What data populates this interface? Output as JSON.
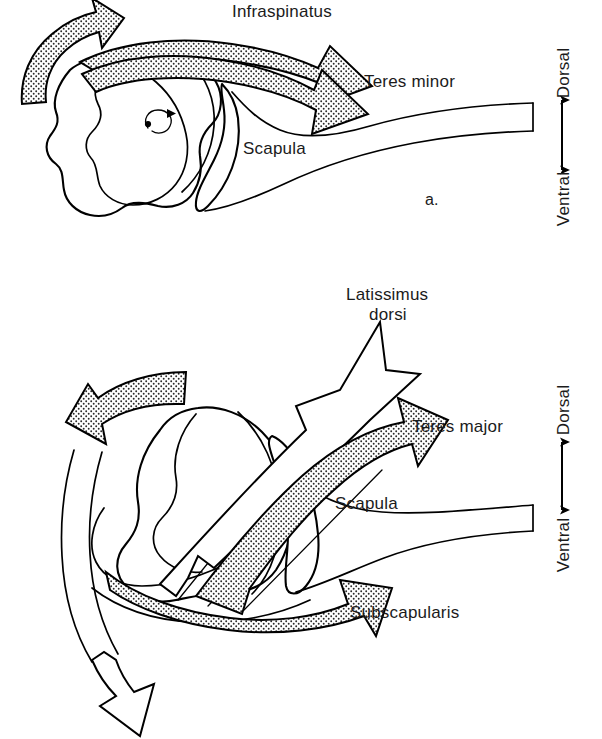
{
  "figure": {
    "panels": [
      {
        "id": "a",
        "panel_label": "a.",
        "labels": {
          "infraspinatus": "Infraspinatus",
          "teres_minor": "Teres minor",
          "scapula": "Scapula"
        },
        "orientation": {
          "dorsal": "Dorsal",
          "ventral": "Ventral"
        }
      },
      {
        "id": "b",
        "panel_label": "",
        "labels": {
          "latissimus_line1": "Latissimus",
          "latissimus_line2": "dorsi",
          "teres_major": "Teres major",
          "scapula": "Scapula",
          "subscapularis": "Subscapularis"
        },
        "orientation": {
          "dorsal": "Dorsal",
          "ventral": "Ventral"
        }
      }
    ]
  },
  "colors": {
    "ink": "#000000",
    "paper": "#ffffff",
    "stipple": "#2a2a2a"
  },
  "icons": {
    "rotation_marker": "rotation-arrow-icon",
    "orientation_axis": "double-headed-arrow-icon"
  }
}
